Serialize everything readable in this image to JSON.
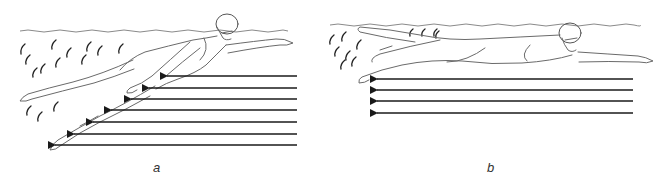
{
  "figure": {
    "panels": [
      {
        "id": "a",
        "label": "a",
        "subject": "swimmer with hips and legs dropped, body angled steeply downward",
        "arrow_count": 7,
        "arrow_direction": "left",
        "arrows": [
          {
            "y": 76,
            "x_tip": 167,
            "x_tail": 297
          },
          {
            "y": 88,
            "x_tip": 149,
            "x_tail": 297
          },
          {
            "y": 99,
            "x_tip": 131,
            "x_tail": 297
          },
          {
            "y": 110,
            "x_tip": 111,
            "x_tail": 297
          },
          {
            "y": 122,
            "x_tip": 93,
            "x_tail": 297
          },
          {
            "y": 134,
            "x_tip": 74,
            "x_tail": 297
          },
          {
            "y": 145,
            "x_tip": 55,
            "x_tail": 297
          }
        ]
      },
      {
        "id": "b",
        "label": "b",
        "subject": "swimmer in streamlined horizontal body position",
        "arrow_count": 4,
        "arrow_direction": "left",
        "arrows": [
          {
            "y": 79,
            "x_tip": 377,
            "x_tail": 633
          },
          {
            "y": 90,
            "x_tip": 377,
            "x_tail": 633
          },
          {
            "y": 101,
            "x_tip": 377,
            "x_tail": 633
          },
          {
            "y": 113,
            "x_tip": 377,
            "x_tail": 633
          }
        ]
      }
    ],
    "colors": {
      "line": "#1a1a1a",
      "sketch": "#6a6a6a",
      "water": "#8a8a8a",
      "background": "#ffffff"
    }
  }
}
